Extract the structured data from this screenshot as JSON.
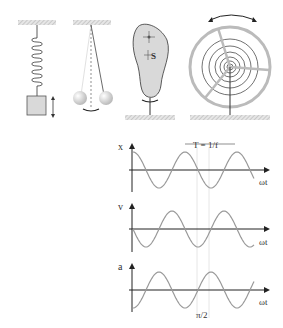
{
  "figure": {
    "oscillators": [
      {
        "name": "spring-mass"
      },
      {
        "name": "pendulum"
      },
      {
        "name": "physical-pendulum",
        "label": "S"
      },
      {
        "name": "torsion-balance-wheel"
      }
    ],
    "graphs": [
      {
        "axis_label": "x",
        "time_label": "ωt",
        "period_label": "T = 1/f",
        "phase": "cos"
      },
      {
        "axis_label": "v",
        "time_label": "ωt",
        "phase": "-sin"
      },
      {
        "axis_label": "a",
        "time_label": "ωt",
        "marker_label": "π/2",
        "phase": "-cos"
      }
    ],
    "colors": {
      "curve": "#999999",
      "axis": "#222222",
      "hatch": "#bbbbbb",
      "fill": "#d9d9d9"
    }
  },
  "chart_data": {
    "type": "line",
    "series": [
      {
        "name": "x",
        "function": "cos(ωt)"
      },
      {
        "name": "v",
        "function": "-sin(ωt)"
      },
      {
        "name": "a",
        "function": "-cos(ωt)"
      }
    ],
    "xlabel": "ωt",
    "annotations": [
      "T = 1/f",
      "π/2"
    ]
  }
}
